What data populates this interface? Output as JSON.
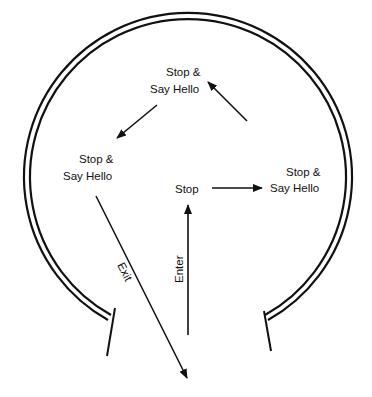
{
  "diagram": {
    "title": "",
    "nodes": [
      {
        "id": "stop",
        "lines": [
          "Stop"
        ]
      },
      {
        "id": "hello_right",
        "lines": [
          "Stop &",
          "Say Hello"
        ]
      },
      {
        "id": "hello_top",
        "lines": [
          "Stop &",
          "Say Hello"
        ]
      },
      {
        "id": "hello_left",
        "lines": [
          "Stop &",
          "Say Hello"
        ]
      }
    ],
    "edges": [
      {
        "from": "entrance",
        "to": "stop",
        "label": "Enter"
      },
      {
        "from": "stop",
        "to": "hello_right",
        "label": ""
      },
      {
        "from": "hello_right",
        "to": "hello_top",
        "label": ""
      },
      {
        "from": "hello_top",
        "to": "hello_left",
        "label": ""
      },
      {
        "from": "hello_left",
        "to": "outside",
        "label": "Exit"
      }
    ],
    "colors": {
      "line": "#111111",
      "background": "#ffffff"
    }
  }
}
